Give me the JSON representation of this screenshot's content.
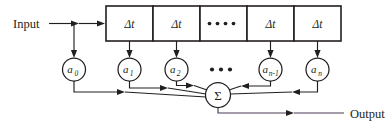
{
  "diagram": {
    "colors": {
      "stroke": "#231f20",
      "output_stroke": "#4a3b52",
      "background": "#ffffff"
    },
    "io": {
      "input_label": "Input",
      "output_label": "Output"
    },
    "delay_line": {
      "box_label": "Δt",
      "boxes": [
        {
          "id": "delay-1",
          "label": "Δt",
          "type": "delay"
        },
        {
          "id": "delay-2",
          "label": "Δt",
          "type": "delay"
        },
        {
          "id": "delay-ellipsis",
          "label": "••••",
          "type": "ellipsis",
          "dot_count": 4
        },
        {
          "id": "delay-3",
          "label": "Δt",
          "type": "delay"
        },
        {
          "id": "delay-4",
          "label": "Δt",
          "type": "delay"
        }
      ]
    },
    "coefficients": [
      {
        "id": "coef-a0",
        "base": "a",
        "sub": "0",
        "full": "a0"
      },
      {
        "id": "coef-a1",
        "base": "a",
        "sub": "1",
        "full": "a1"
      },
      {
        "id": "coef-a2",
        "base": "a",
        "sub": "2",
        "full": "a2"
      },
      {
        "id": "coef-ellipsis",
        "base": "•••",
        "sub": "",
        "full": "•••",
        "dot_count": 3
      },
      {
        "id": "coef-an1",
        "base": "a",
        "sub": "n-1",
        "full": "an-1"
      },
      {
        "id": "coef-an",
        "base": "a",
        "sub": "n",
        "full": "an"
      }
    ],
    "summation": {
      "id": "summation-node",
      "label": "Σ",
      "name": "sigma"
    }
  }
}
